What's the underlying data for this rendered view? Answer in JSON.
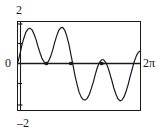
{
  "figure": {
    "name": "sinusoid-plot",
    "background": "#ffffff",
    "ink": "#1a1a1a"
  },
  "labels": {
    "y_max": "2",
    "y_zero": "0",
    "y_min": "–2",
    "x_max": "2π"
  },
  "chart_data": {
    "type": "line",
    "title": "",
    "xlabel": "",
    "ylabel": "",
    "xlim": [
      0,
      6.2832
    ],
    "ylim": [
      -2,
      2
    ],
    "xticks": [
      0,
      6.2832
    ],
    "xticklabels": [
      "0",
      "2π"
    ],
    "yticks": [
      -2,
      0,
      2
    ],
    "yticklabels": [
      "–2",
      "0",
      "2"
    ],
    "grid": false,
    "legend": false,
    "axis_line_y": 0,
    "series": [
      {
        "name": "curve",
        "x": [
          0.0,
          0.1,
          0.2,
          0.31,
          0.41,
          0.52,
          0.62,
          0.73,
          0.83,
          0.94,
          1.04,
          1.15,
          1.25,
          1.36,
          1.46,
          1.57,
          1.67,
          1.78,
          1.88,
          1.99,
          2.09,
          2.2,
          2.3,
          2.41,
          2.51,
          2.62,
          2.72,
          2.83,
          2.93,
          3.04,
          3.14,
          3.25,
          3.35,
          3.46,
          3.56,
          3.67,
          3.77,
          3.88,
          3.98,
          4.08,
          4.19,
          4.29,
          4.4,
          4.5,
          4.61,
          4.71,
          4.82,
          4.92,
          5.03,
          5.13,
          5.24,
          5.34,
          5.45,
          5.55,
          5.66,
          5.76,
          5.87,
          5.97,
          6.08,
          6.18,
          6.28
        ],
        "y": [
          0.05,
          0.42,
          0.85,
          1.22,
          1.5,
          1.66,
          1.7,
          1.62,
          1.42,
          1.14,
          0.8,
          0.48,
          0.22,
          0.06,
          0.02,
          0.1,
          0.31,
          0.62,
          0.98,
          1.32,
          1.58,
          1.72,
          1.74,
          1.6,
          1.32,
          0.92,
          0.44,
          -0.08,
          -0.58,
          -1.02,
          -1.38,
          -1.62,
          -1.74,
          -1.76,
          -1.68,
          -1.48,
          -1.2,
          -0.86,
          -0.5,
          -0.18,
          0.06,
          0.18,
          0.18,
          0.06,
          -0.16,
          -0.46,
          -0.82,
          -1.18,
          -1.48,
          -1.7,
          -1.8,
          -1.76,
          -1.6,
          -1.34,
          -1.0,
          -0.62,
          -0.24,
          0.1,
          0.38,
          0.54,
          0.6
        ],
        "color": "#1a1a1a",
        "linewidth": 1.2
      }
    ],
    "markers": [
      {
        "x": 1.46,
        "y": 0.0,
        "name": "axis-touch-point-1"
      },
      {
        "x": 2.72,
        "y": 0.0,
        "name": "axis-crossing-point-2"
      },
      {
        "x": 4.3,
        "y": 0.0,
        "name": "axis-crossing-point-3"
      }
    ],
    "ytick_marks": [
      2,
      1,
      -1,
      -2
    ]
  }
}
